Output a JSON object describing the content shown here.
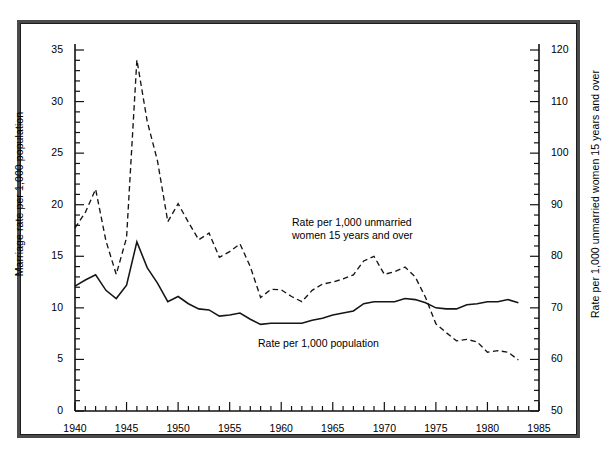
{
  "figure": {
    "background": "#ffffff",
    "frame_color": "#4a4a4a",
    "line_color": "#1a1a1a"
  },
  "annotations": {
    "unmarried_line1": "Rate per 1,000 unmarried",
    "unmarried_line2": "women 15 years and over",
    "population": "Rate per 1,000 population"
  },
  "axis_titles": {
    "left": "Marriage rate per 1,000 population",
    "right": "Rate per 1,000 unmarried women 15 years and over"
  },
  "ticks": {
    "left": [
      "0",
      "5",
      "10",
      "15",
      "20",
      "25",
      "30",
      "35"
    ],
    "right": [
      "50",
      "60",
      "70",
      "80",
      "90",
      "100",
      "110",
      "120"
    ],
    "x": [
      "1940",
      "1945",
      "1950",
      "1955",
      "1960",
      "1965",
      "1970",
      "1975",
      "1980",
      "1985"
    ]
  },
  "chart_data": {
    "type": "line",
    "title": "",
    "xlabel": "",
    "ylabel": "Marriage rate per 1,000 population",
    "ylabel_right": "Rate per 1,000 unmarried women 15 years and over",
    "xlim": [
      1940,
      1985
    ],
    "ylim": [
      0,
      35
    ],
    "ylim_right": [
      50,
      120
    ],
    "grid": false,
    "legend": "inline-annotations",
    "x": [
      1940,
      1941,
      1942,
      1943,
      1944,
      1945,
      1946,
      1947,
      1948,
      1949,
      1950,
      1951,
      1952,
      1953,
      1954,
      1955,
      1956,
      1957,
      1958,
      1959,
      1960,
      1961,
      1962,
      1963,
      1964,
      1965,
      1966,
      1967,
      1968,
      1969,
      1970,
      1971,
      1972,
      1973,
      1974,
      1975,
      1976,
      1977,
      1978,
      1979,
      1980,
      1981,
      1982,
      1983
    ],
    "series": [
      {
        "name": "Rate per 1,000 population",
        "axis": "left",
        "style": "solid",
        "values": [
          12.1,
          12.7,
          13.2,
          11.7,
          10.9,
          12.2,
          16.4,
          13.9,
          12.4,
          10.6,
          11.1,
          10.4,
          9.9,
          9.8,
          9.2,
          9.3,
          9.5,
          8.9,
          8.4,
          8.5,
          8.5,
          8.5,
          8.5,
          8.8,
          9.0,
          9.3,
          9.5,
          9.7,
          10.4,
          10.6,
          10.6,
          10.6,
          10.9,
          10.8,
          10.5,
          10.0,
          9.9,
          9.9,
          10.3,
          10.4,
          10.6,
          10.6,
          10.8,
          10.5
        ]
      },
      {
        "name": "Rate per 1,000 unmarried women 15 years and over",
        "axis": "right",
        "style": "dashed",
        "values": [
          85.5,
          88.5,
          93.0,
          83.0,
          76.5,
          83.6,
          118.1,
          106.2,
          98.5,
          86.7,
          90.2,
          86.6,
          83.2,
          84.5,
          79.8,
          80.9,
          82.4,
          78.0,
          72.0,
          73.6,
          73.5,
          72.2,
          71.2,
          73.4,
          74.6,
          75.0,
          75.6,
          76.4,
          79.1,
          80.0,
          76.5,
          77.0,
          77.9,
          76.0,
          72.0,
          66.9,
          65.2,
          63.6,
          63.9,
          63.4,
          61.4,
          61.7,
          61.4,
          59.9
        ]
      }
    ]
  }
}
